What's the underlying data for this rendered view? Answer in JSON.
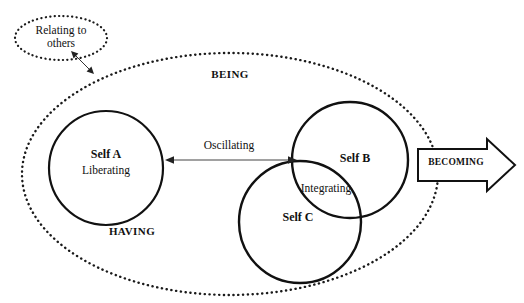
{
  "diagram": {
    "canvas": {
      "width": 524,
      "height": 303,
      "background": "#ffffff"
    },
    "colors": {
      "stroke": "#111111",
      "dotted_stroke": "#1a1a1a",
      "thin_stroke": "#444444",
      "text": "#111111"
    },
    "outer_boundary": {
      "name": "being-having-ellipse",
      "style": "dotted",
      "cx": 230,
      "cy": 174,
      "rx": 208,
      "ry": 121
    },
    "satellite": {
      "name": "relating-to-others-ellipse",
      "style": "dotted",
      "label": "Relating to\nothers",
      "line1": "Relating to",
      "line2": "others",
      "cx": 61,
      "cy": 38,
      "rx": 46,
      "ry": 22
    },
    "region_labels": [
      {
        "id": "being",
        "text": "BEING"
      },
      {
        "id": "having",
        "text": "HAVING"
      }
    ],
    "selves": [
      {
        "id": "self-a",
        "title": "Self A",
        "subtitle": "Liberating",
        "cx": 106,
        "cy": 168,
        "r": 57
      },
      {
        "id": "self-b",
        "title": "Self B",
        "subtitle": "",
        "cx": 350,
        "cy": 160,
        "r": 58
      },
      {
        "id": "self-c",
        "title": "Self C",
        "subtitle": "",
        "cx": 300,
        "cy": 222,
        "r": 61
      }
    ],
    "connectors": [
      {
        "id": "oscillating-arrow",
        "label": "Oscillating",
        "type": "double-headed-arrow",
        "from": "self-a",
        "to": "self-b",
        "x1": 166,
        "y1": 160,
        "x2": 296,
        "y2": 160
      },
      {
        "id": "relating-arrow",
        "label": "",
        "type": "double-headed-arrow",
        "from": "relating-to-others-ellipse",
        "to": "being-having-ellipse",
        "x1": 71,
        "y1": 51,
        "x2": 94,
        "y2": 74
      },
      {
        "id": "integrating-overlap",
        "label": "Integrating",
        "type": "overlap-region",
        "between": [
          "self-b",
          "self-c"
        ]
      },
      {
        "id": "becoming-arrow",
        "label": "BECOMING",
        "type": "block-arrow",
        "direction": "right",
        "x": 418,
        "y": 146,
        "width": 97,
        "height": 39
      }
    ]
  }
}
